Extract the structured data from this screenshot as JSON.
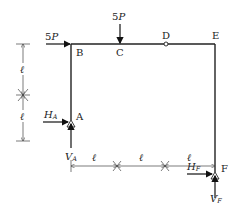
{
  "diagram": {
    "type": "structural-frame",
    "nodes": [
      {
        "id": "A",
        "label": "A",
        "role": "pin support"
      },
      {
        "id": "B",
        "label": "B",
        "role": "corner"
      },
      {
        "id": "C",
        "label": "C",
        "role": "load point"
      },
      {
        "id": "D",
        "label": "D",
        "role": "internal hinge"
      },
      {
        "id": "E",
        "label": "E",
        "role": "corner"
      },
      {
        "id": "F",
        "label": "F",
        "role": "pin support"
      }
    ],
    "loads": [
      {
        "at": "B",
        "label": "5P",
        "direction": "right"
      },
      {
        "at": "C",
        "label": "5P",
        "direction": "down"
      }
    ],
    "reactions": [
      {
        "at": "A",
        "label": "H",
        "sub": "A",
        "direction": "right"
      },
      {
        "at": "A",
        "label": "V",
        "sub": "A",
        "direction": "up"
      },
      {
        "at": "F",
        "label": "H",
        "sub": "F",
        "direction": "right"
      },
      {
        "at": "F",
        "label": "V",
        "sub": "F",
        "direction": "up"
      }
    ],
    "dimensions": {
      "vertical": [
        "ℓ",
        "ℓ"
      ],
      "horizontal": [
        "ℓ",
        "ℓ",
        "ℓ"
      ]
    }
  }
}
